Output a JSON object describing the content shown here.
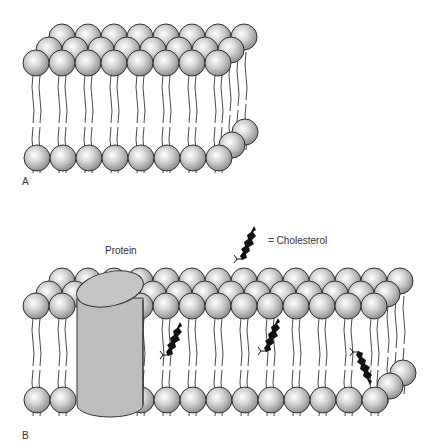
{
  "figure": {
    "panel_a": {
      "label": "A"
    },
    "panel_b": {
      "label": "B",
      "protein_label": "Protein",
      "legend": {
        "text": "= Cholesterol",
        "icon": "cholesterol-icon"
      }
    }
  },
  "colors": {
    "sphere_fill": "#c8c8c8",
    "sphere_stroke": "#333333",
    "protein_fill": "#bdbdbd",
    "cholesterol": "#111111",
    "background": "#ffffff"
  }
}
